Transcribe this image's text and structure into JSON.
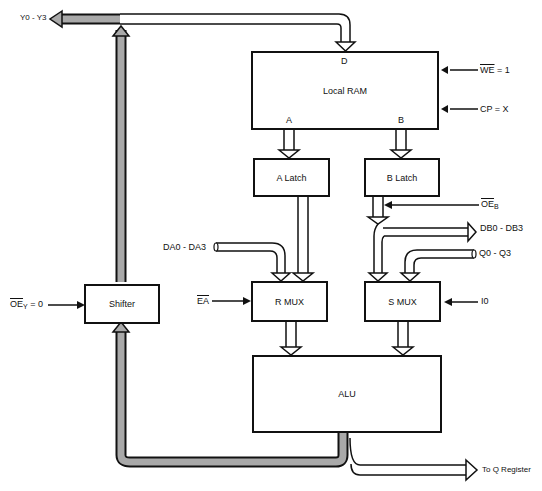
{
  "diagram": {
    "type": "block-diagram",
    "blocks": {
      "local_ram": {
        "label": "Local RAM",
        "port_d": "D",
        "port_a": "A",
        "port_b": "B"
      },
      "a_latch": {
        "label": "A Latch"
      },
      "b_latch": {
        "label": "B Latch"
      },
      "r_mux": {
        "label": "R MUX"
      },
      "s_mux": {
        "label": "S MUX"
      },
      "alu": {
        "label": "ALU"
      },
      "shifter": {
        "label": "Shifter"
      }
    },
    "signals": {
      "y_out": "Y0 - Y3",
      "we_name": "WE",
      "we_value": " = 1",
      "cp": "CP = X",
      "oeb_name": "OE",
      "oeb_sub": "B",
      "db": "DB0 - DB3",
      "q": "Q0 - Q3",
      "da": "DA0 - DA3",
      "ea": "EA",
      "i0": "I0",
      "oey_name": "OE",
      "oey_sub": "Y",
      "oey_value": " = 0",
      "to_q": "To Q Register"
    },
    "colors": {
      "line": "#111111",
      "shaded_bus": "#a9a9a9",
      "background": "#ffffff"
    }
  }
}
